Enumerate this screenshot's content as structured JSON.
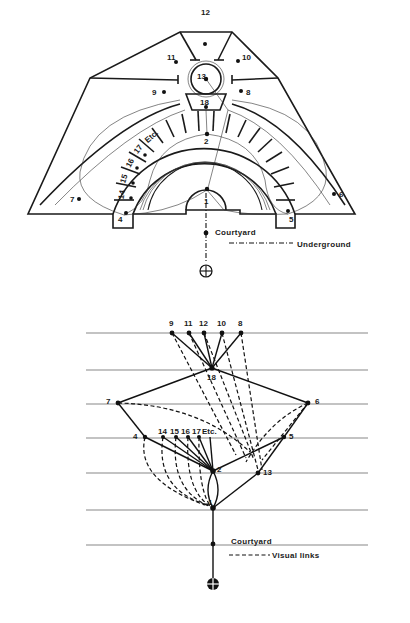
{
  "figure": {
    "plan": {
      "title": "Plan of building around courtyard",
      "node_labels": {
        "n1": "1",
        "n2": "2",
        "n4": "4",
        "n5": "5",
        "n6": "6",
        "n7": "7",
        "n8": "8",
        "n9": "9",
        "n10": "10",
        "n11": "11",
        "n12": "12",
        "n13": "13",
        "n14": "14",
        "n15": "15",
        "n16": "16",
        "n17": "17",
        "n18": "18",
        "etc": "Etc."
      },
      "courtyard_label": "Courtyard",
      "legend": {
        "underground_label": "Underground"
      }
    },
    "graph": {
      "title": "Justified access graph",
      "levels": 7,
      "nodes": [
        {
          "id": "9",
          "label": "9",
          "level": 0
        },
        {
          "id": "11",
          "label": "11",
          "level": 0
        },
        {
          "id": "12",
          "label": "12",
          "level": 0
        },
        {
          "id": "10",
          "label": "10",
          "level": 0
        },
        {
          "id": "8",
          "label": "8",
          "level": 0
        },
        {
          "id": "18",
          "label": "18",
          "level": 1
        },
        {
          "id": "7",
          "label": "7",
          "level": 2
        },
        {
          "id": "6",
          "label": "6",
          "level": 2
        },
        {
          "id": "4",
          "label": "4",
          "level": 3
        },
        {
          "id": "14",
          "label": "14",
          "level": 3
        },
        {
          "id": "15",
          "label": "15",
          "level": 3
        },
        {
          "id": "16",
          "label": "16",
          "level": 3
        },
        {
          "id": "17",
          "label": "17",
          "level": 3
        },
        {
          "id": "etc",
          "label": "Etc.",
          "level": 3
        },
        {
          "id": "5",
          "label": "5",
          "level": 3
        },
        {
          "id": "2",
          "label": "2",
          "level": 4
        },
        {
          "id": "13",
          "label": "13",
          "level": 4
        },
        {
          "id": "1",
          "label": "1",
          "level": 5
        },
        {
          "id": "courtyard",
          "label": "Courtyard",
          "level": 6
        },
        {
          "id": "outside",
          "label": "",
          "level": 7
        }
      ],
      "labels": {
        "n1": "1",
        "n2": "2",
        "n4": "4",
        "n5": "5",
        "n6": "6",
        "n7": "7",
        "n8": "8",
        "n9": "9",
        "n10": "10",
        "n11": "11",
        "n12": "12",
        "n13": "13",
        "n14": "14",
        "n15": "15",
        "n16": "16",
        "n17": "17",
        "n18": "18",
        "etc": "Etc."
      },
      "courtyard_label": "Courtyard",
      "legend": {
        "visual_links_label": "Visual links"
      }
    }
  }
}
